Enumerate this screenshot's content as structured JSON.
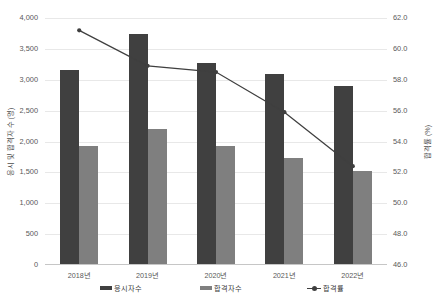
{
  "chart_data": {
    "type": "bar",
    "title": "",
    "subtitle": "",
    "xlabel": "",
    "ylabel": "응시 및 합격자 수 (명)",
    "y2label": "합격률 (%)",
    "categories": [
      "2018년",
      "2019년",
      "2020년",
      "2021년",
      "2022년"
    ],
    "series": [
      {
        "name": "응시자수",
        "type": "bar",
        "axis": "left",
        "color": "#404040",
        "values": [
          3155,
          3740,
          3270,
          3090,
          2900
        ]
      },
      {
        "name": "합격자수",
        "type": "bar",
        "axis": "left",
        "color": "#7f7f7f",
        "values": [
          1930,
          2205,
          1925,
          1730,
          1520
        ]
      },
      {
        "name": "합격률",
        "type": "line",
        "axis": "right",
        "color": "#3f3f3f",
        "values": [
          61.2,
          58.9,
          58.5,
          55.9,
          52.4
        ]
      }
    ],
    "ylim": [
      0,
      4000
    ],
    "yticks": [
      "0",
      "500",
      "1,000",
      "1,500",
      "2,000",
      "2,500",
      "3,000",
      "3,500",
      "4,000"
    ],
    "ytick_values": [
      0,
      500,
      1000,
      1500,
      2000,
      2500,
      3000,
      3500,
      4000
    ],
    "y2lim": [
      46.0,
      62.0
    ],
    "y2ticks": [
      "46.0",
      "48.0",
      "50.0",
      "52.0",
      "54.0",
      "56.0",
      "58.0",
      "60.0",
      "62.0"
    ],
    "y2tick_values": [
      46.0,
      48.0,
      50.0,
      52.0,
      54.0,
      56.0,
      58.0,
      60.0,
      62.0
    ],
    "grid": true,
    "legend_position": "bottom"
  },
  "legend": {
    "items": [
      {
        "label": "응시자수",
        "color": "#404040",
        "marker": "bar-swatch"
      },
      {
        "label": "합격자수",
        "color": "#7f7f7f",
        "marker": "bar-swatch"
      },
      {
        "label": "합격률",
        "color": "#3f3f3f",
        "marker": "line-marker"
      }
    ]
  },
  "axes": {
    "left_title": "응시 및 합격자 수 (명)",
    "right_title": "합격률 (%)"
  }
}
